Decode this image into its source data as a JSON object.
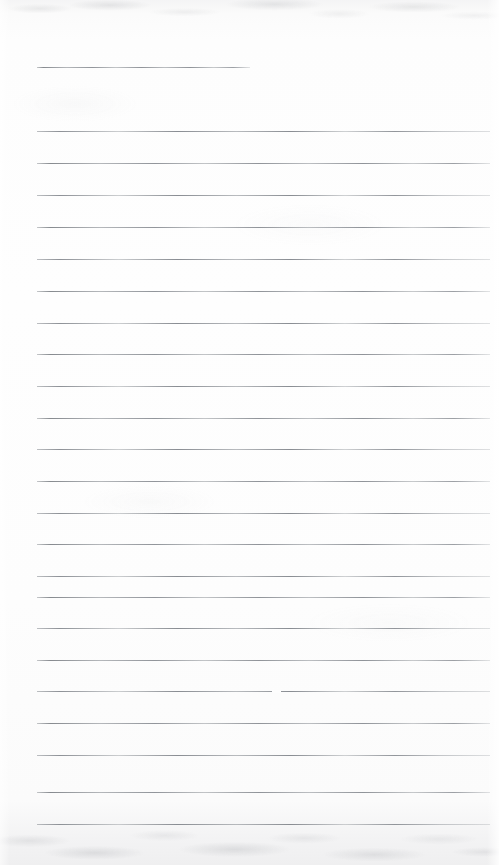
{
  "document": {
    "kind": "scanned-lined-paper",
    "title": "Blank ruled notebook page (scan)",
    "page_width": 499,
    "page_height": 865,
    "paper_color": "#fdfdfd",
    "rule_color": "#b5b9bd",
    "rule_thickness_px": 1,
    "rule_left_x": 37,
    "rule_right_x": 490,
    "rule_spacing_px": 31.5,
    "written_text": "",
    "visible_text_lines": []
  },
  "edges": {
    "top_band_label": "scanner-shadow-top",
    "bottom_band_label": "scanner-shadow-bottom",
    "right_falloff_label": "scanner-light-falloff-right"
  },
  "rules": [
    {
      "id": "rule-1",
      "y": 67,
      "x1": 37,
      "x2": 250,
      "partial": true,
      "content": ""
    },
    {
      "id": "rule-2",
      "y": 131,
      "x1": 37,
      "x2": 490,
      "partial": false,
      "content": ""
    },
    {
      "id": "rule-3",
      "y": 163,
      "x1": 37,
      "x2": 490,
      "partial": false,
      "content": ""
    },
    {
      "id": "rule-4",
      "y": 195,
      "x1": 37,
      "x2": 490,
      "partial": false,
      "content": ""
    },
    {
      "id": "rule-5",
      "y": 227,
      "x1": 37,
      "x2": 490,
      "partial": false,
      "content": ""
    },
    {
      "id": "rule-6",
      "y": 259,
      "x1": 37,
      "x2": 490,
      "partial": false,
      "content": ""
    },
    {
      "id": "rule-7",
      "y": 291,
      "x1": 37,
      "x2": 490,
      "partial": false,
      "content": ""
    },
    {
      "id": "rule-8",
      "y": 323,
      "x1": 37,
      "x2": 490,
      "partial": false,
      "content": ""
    },
    {
      "id": "rule-9",
      "y": 354,
      "x1": 37,
      "x2": 490,
      "partial": false,
      "content": ""
    },
    {
      "id": "rule-10",
      "y": 386,
      "x1": 37,
      "x2": 490,
      "partial": false,
      "content": ""
    },
    {
      "id": "rule-11",
      "y": 418,
      "x1": 37,
      "x2": 490,
      "partial": false,
      "content": ""
    },
    {
      "id": "rule-12",
      "y": 449,
      "x1": 37,
      "x2": 490,
      "partial": false,
      "content": ""
    },
    {
      "id": "rule-13",
      "y": 481,
      "x1": 37,
      "x2": 490,
      "partial": false,
      "content": ""
    },
    {
      "id": "rule-14",
      "y": 513,
      "x1": 37,
      "x2": 490,
      "partial": false,
      "content": ""
    },
    {
      "id": "rule-15",
      "y": 544,
      "x1": 37,
      "x2": 490,
      "partial": false,
      "content": ""
    },
    {
      "id": "rule-16",
      "y": 576,
      "x1": 37,
      "x2": 490,
      "partial": false,
      "content": ""
    },
    {
      "id": "rule-17",
      "y": 597,
      "x1": 37,
      "x2": 490,
      "partial": false,
      "content": ""
    },
    {
      "id": "rule-18",
      "y": 628,
      "x1": 37,
      "x2": 490,
      "partial": false,
      "content": ""
    },
    {
      "id": "rule-19",
      "y": 660,
      "x1": 37,
      "x2": 490,
      "partial": false,
      "content": ""
    },
    {
      "id": "rule-20",
      "y": 691,
      "x1": 37,
      "x2": 490,
      "partial": false,
      "content": "",
      "dropout_x": 272,
      "dropout_w": 9
    },
    {
      "id": "rule-21",
      "y": 723,
      "x1": 37,
      "x2": 490,
      "partial": false,
      "content": ""
    },
    {
      "id": "rule-22",
      "y": 755,
      "x1": 37,
      "x2": 490,
      "partial": false,
      "content": ""
    },
    {
      "id": "rule-23",
      "y": 792,
      "x1": 37,
      "x2": 490,
      "partial": false,
      "content": ""
    },
    {
      "id": "rule-24",
      "y": 824,
      "x1": 37,
      "x2": 490,
      "partial": false,
      "content": ""
    }
  ]
}
